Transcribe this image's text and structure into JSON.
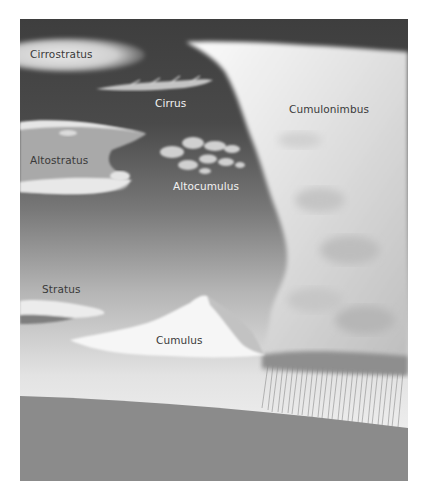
{
  "figure": {
    "colors": {
      "sky_top": "#3e3e3e",
      "sky_mid": "#7a7a7a",
      "sky_low": "#cfcfcf",
      "sky_horizon": "#ededed",
      "ground": "#8b8b8b",
      "cloud_white": "#f5f5f5",
      "cloud_shadow": "#9a9a9a",
      "rain": "#8a8a8a"
    },
    "clouds": [
      {
        "id": "cirrostratus",
        "label": "Cirrostratus",
        "label_color": "dark"
      },
      {
        "id": "cirrus",
        "label": "Cirrus",
        "label_color": "light"
      },
      {
        "id": "altostratus",
        "label": "Altostratus",
        "label_color": "dark"
      },
      {
        "id": "altocumulus",
        "label": "Altocumulus",
        "label_color": "light"
      },
      {
        "id": "cumulonimbus",
        "label": "Cumulonimbus",
        "label_color": "dark"
      },
      {
        "id": "stratus",
        "label": "Stratus",
        "label_color": "dark"
      },
      {
        "id": "cumulus",
        "label": "Cumulus",
        "label_color": "dark"
      }
    ]
  }
}
